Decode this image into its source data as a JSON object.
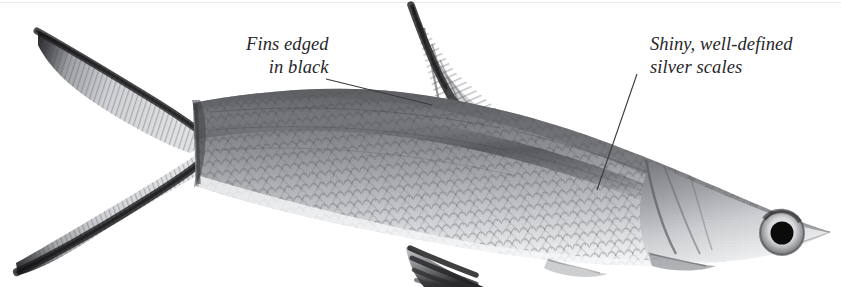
{
  "figure": {
    "background_color": "#ffffff",
    "top_rule_color": "#e9e9ea",
    "ink_color": "#27262a",
    "body_dark": "#6d6f72",
    "body_mid": "#a3a5a8",
    "body_light": "#dcdde0",
    "fin_black": "#1c1c1e"
  },
  "callouts": [
    {
      "id": "fins-edged-in-black",
      "line1": "Fins edged",
      "line2": "in black",
      "align": "right",
      "leader": {
        "x1": 326,
        "y1": 79,
        "x2": 432,
        "y2": 105
      }
    },
    {
      "id": "shiny-well-defined-silver-scales",
      "line1": "Shiny, well-defined",
      "line2": "silver scales",
      "align": "left",
      "leader": {
        "x1": 637,
        "y1": 74,
        "x2": 597,
        "y2": 190
      }
    }
  ],
  "anatomy": {
    "caudal_fin_label": "caudal-fin",
    "dorsal_fin_label": "dorsal-fin",
    "anal_fin_label": "anal-fin",
    "pelvic_fin_label": "pelvic-fin",
    "pectoral_fin_label": "pectoral-fin",
    "body_label": "fish-body",
    "head_label": "fish-head",
    "eye_label": "fish-eye",
    "scales_label": "scale-texture",
    "lateral_stripe_label": "lateral-stripe"
  }
}
